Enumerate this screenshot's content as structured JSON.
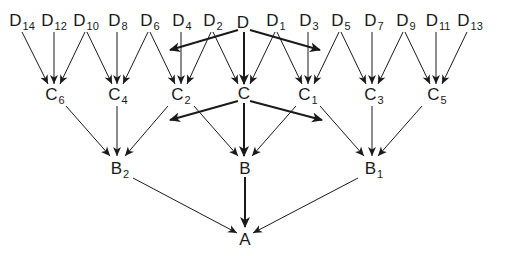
{
  "diagram": {
    "type": "hierarchical-tree",
    "colors": {
      "line": "#1a1a1a",
      "background": "#ffffff"
    },
    "nodes": [
      {
        "id": "D14",
        "base": "D",
        "sub": "14",
        "x": 22,
        "y": 22
      },
      {
        "id": "D12",
        "base": "D",
        "sub": "12",
        "x": 54,
        "y": 22
      },
      {
        "id": "D10",
        "base": "D",
        "sub": "10",
        "x": 86,
        "y": 22
      },
      {
        "id": "D8",
        "base": "D",
        "sub": "8",
        "x": 118,
        "y": 22
      },
      {
        "id": "D6",
        "base": "D",
        "sub": "6",
        "x": 150,
        "y": 22
      },
      {
        "id": "D4",
        "base": "D",
        "sub": "4",
        "x": 182,
        "y": 22
      },
      {
        "id": "D2",
        "base": "D",
        "sub": "2",
        "x": 213,
        "y": 22
      },
      {
        "id": "D",
        "base": "D",
        "sub": "",
        "x": 243,
        "y": 22
      },
      {
        "id": "D1",
        "base": "D",
        "sub": "1",
        "x": 276,
        "y": 22
      },
      {
        "id": "D3",
        "base": "D",
        "sub": "3",
        "x": 309,
        "y": 22
      },
      {
        "id": "D5",
        "base": "D",
        "sub": "5",
        "x": 341,
        "y": 22
      },
      {
        "id": "D7",
        "base": "D",
        "sub": "7",
        "x": 374,
        "y": 22
      },
      {
        "id": "D9",
        "base": "D",
        "sub": "9",
        "x": 406,
        "y": 22
      },
      {
        "id": "D11",
        "base": "D",
        "sub": "11",
        "x": 438,
        "y": 22
      },
      {
        "id": "D13",
        "base": "D",
        "sub": "13",
        "x": 470,
        "y": 22
      },
      {
        "id": "C6",
        "base": "C",
        "sub": "6",
        "x": 55,
        "y": 96
      },
      {
        "id": "C4",
        "base": "C",
        "sub": "4",
        "x": 118,
        "y": 96
      },
      {
        "id": "C2",
        "base": "C",
        "sub": "2",
        "x": 181,
        "y": 96
      },
      {
        "id": "C",
        "base": "C",
        "sub": "",
        "x": 244,
        "y": 93
      },
      {
        "id": "C1",
        "base": "C",
        "sub": "1",
        "x": 308,
        "y": 96
      },
      {
        "id": "C3",
        "base": "C",
        "sub": "3",
        "x": 374,
        "y": 96
      },
      {
        "id": "C5",
        "base": "C",
        "sub": "5",
        "x": 437,
        "y": 96
      },
      {
        "id": "B2",
        "base": "B",
        "sub": "2",
        "x": 120,
        "y": 170
      },
      {
        "id": "B",
        "base": "B",
        "sub": "",
        "x": 245,
        "y": 168
      },
      {
        "id": "B1",
        "base": "B",
        "sub": "1",
        "x": 374,
        "y": 170
      },
      {
        "id": "A",
        "base": "A",
        "sub": "",
        "x": 245,
        "y": 239
      }
    ],
    "edges": [
      {
        "from": [
          22,
          32
        ],
        "to": [
          48,
          84
        ],
        "thick": false,
        "label": "D14-C6"
      },
      {
        "from": [
          54,
          32
        ],
        "to": [
          54,
          84
        ],
        "thick": false,
        "label": "D12-C6"
      },
      {
        "from": [
          85,
          32
        ],
        "to": [
          60,
          84
        ],
        "thick": false,
        "label": "D10-C6"
      },
      {
        "from": [
          87,
          32
        ],
        "to": [
          112,
          84
        ],
        "thick": false,
        "label": "D10-C4"
      },
      {
        "from": [
          117,
          32
        ],
        "to": [
          117,
          84
        ],
        "thick": false,
        "label": "D8-C4"
      },
      {
        "from": [
          148,
          32
        ],
        "to": [
          123,
          84
        ],
        "thick": false,
        "label": "D6-C4"
      },
      {
        "from": [
          150,
          32
        ],
        "to": [
          175,
          84
        ],
        "thick": false,
        "label": "D6-C2"
      },
      {
        "from": [
          181,
          32
        ],
        "to": [
          181,
          84
        ],
        "thick": false,
        "label": "D4-C2"
      },
      {
        "from": [
          211,
          32
        ],
        "to": [
          187,
          84
        ],
        "thick": false,
        "label": "D2-C2"
      },
      {
        "from": [
          213,
          32
        ],
        "to": [
          238,
          84
        ],
        "thick": false,
        "label": "D2-C"
      },
      {
        "from": [
          244,
          32
        ],
        "to": [
          244,
          84
        ],
        "thick": true,
        "label": "D-C"
      },
      {
        "from": [
          238,
          30
        ],
        "to": [
          170,
          50
        ],
        "thick": true,
        "label": "D-left"
      },
      {
        "from": [
          250,
          30
        ],
        "to": [
          320,
          50
        ],
        "thick": true,
        "label": "D-right"
      },
      {
        "from": [
          275,
          32
        ],
        "to": [
          250,
          84
        ],
        "thick": false,
        "label": "D1-C"
      },
      {
        "from": [
          277,
          32
        ],
        "to": [
          302,
          84
        ],
        "thick": false,
        "label": "D1-C1"
      },
      {
        "from": [
          308,
          32
        ],
        "to": [
          308,
          84
        ],
        "thick": false,
        "label": "D3-C1"
      },
      {
        "from": [
          339,
          32
        ],
        "to": [
          314,
          84
        ],
        "thick": false,
        "label": "D5-C1"
      },
      {
        "from": [
          341,
          32
        ],
        "to": [
          366,
          84
        ],
        "thick": false,
        "label": "D5-C3"
      },
      {
        "from": [
          372,
          32
        ],
        "to": [
          372,
          84
        ],
        "thick": false,
        "label": "D7-C3"
      },
      {
        "from": [
          403,
          32
        ],
        "to": [
          378,
          84
        ],
        "thick": false,
        "label": "D9-C3"
      },
      {
        "from": [
          405,
          32
        ],
        "to": [
          430,
          84
        ],
        "thick": false,
        "label": "D9-C5"
      },
      {
        "from": [
          436,
          32
        ],
        "to": [
          436,
          84
        ],
        "thick": false,
        "label": "D11-C5"
      },
      {
        "from": [
          467,
          32
        ],
        "to": [
          442,
          84
        ],
        "thick": false,
        "label": "D13-C5"
      },
      {
        "from": [
          66,
          106
        ],
        "to": [
          110,
          156
        ],
        "thick": false,
        "label": "C6-B2"
      },
      {
        "from": [
          117,
          106
        ],
        "to": [
          117,
          156
        ],
        "thick": false,
        "label": "C4-B2"
      },
      {
        "from": [
          168,
          106
        ],
        "to": [
          125,
          156
        ],
        "thick": false,
        "label": "C2-B2"
      },
      {
        "from": [
          194,
          106
        ],
        "to": [
          238,
          156
        ],
        "thick": false,
        "label": "C2-B"
      },
      {
        "from": [
          244,
          103
        ],
        "to": [
          244,
          156
        ],
        "thick": true,
        "label": "C-B"
      },
      {
        "from": [
          238,
          101
        ],
        "to": [
          170,
          120
        ],
        "thick": true,
        "label": "C-left"
      },
      {
        "from": [
          250,
          101
        ],
        "to": [
          322,
          120
        ],
        "thick": true,
        "label": "C-right"
      },
      {
        "from": [
          296,
          106
        ],
        "to": [
          252,
          156
        ],
        "thick": false,
        "label": "C1-B"
      },
      {
        "from": [
          320,
          106
        ],
        "to": [
          364,
          156
        ],
        "thick": false,
        "label": "C1-B1"
      },
      {
        "from": [
          372,
          106
        ],
        "to": [
          372,
          156
        ],
        "thick": false,
        "label": "C3-B1"
      },
      {
        "from": [
          422,
          106
        ],
        "to": [
          378,
          156
        ],
        "thick": false,
        "label": "C5-B1"
      },
      {
        "from": [
          133,
          178
        ],
        "to": [
          237,
          233
        ],
        "thick": false,
        "label": "B2-A"
      },
      {
        "from": [
          245,
          177
        ],
        "to": [
          245,
          227
        ],
        "thick": true,
        "label": "B-A"
      },
      {
        "from": [
          358,
          178
        ],
        "to": [
          253,
          233
        ],
        "thick": false,
        "label": "B1-A"
      }
    ]
  }
}
